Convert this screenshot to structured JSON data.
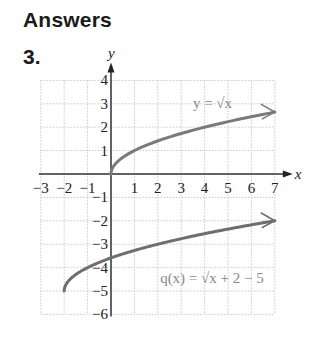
{
  "page": {
    "heading": "Answers",
    "problem_number": "3."
  },
  "chart_data": {
    "type": "line",
    "title": "",
    "xlabel": "x",
    "ylabel": "y",
    "xlim": [
      -3,
      7
    ],
    "ylim": [
      -6,
      4
    ],
    "grid": true,
    "x_ticks": [
      "−3",
      "−2",
      "−1",
      "1",
      "2",
      "3",
      "4",
      "5",
      "6",
      "7"
    ],
    "y_ticks": [
      "4",
      "3",
      "2",
      "1",
      "−1",
      "−2",
      "−3",
      "−4",
      "−5",
      "−6"
    ],
    "series": [
      {
        "name": "y = √x",
        "label_text": "y = √x",
        "color": "#7a7a7a",
        "x": [
          0,
          0.25,
          1,
          2,
          3,
          4,
          5,
          6,
          7
        ],
        "y": [
          0,
          0.5,
          1,
          1.414,
          1.732,
          2,
          2.236,
          2.449,
          2.646
        ]
      },
      {
        "name": "q(x) = √(x + 2) − 5",
        "label_text": "q(x) = √x + 2 − 5",
        "color": "#6e6e6e",
        "x": [
          -2,
          -1.75,
          -1,
          0,
          1,
          2,
          3,
          4,
          5,
          6,
          7
        ],
        "y": [
          -5,
          -4.5,
          -4,
          -3.586,
          -3.268,
          -3,
          -2.764,
          -2.551,
          -2.354,
          -2.172,
          -2
        ]
      }
    ]
  }
}
